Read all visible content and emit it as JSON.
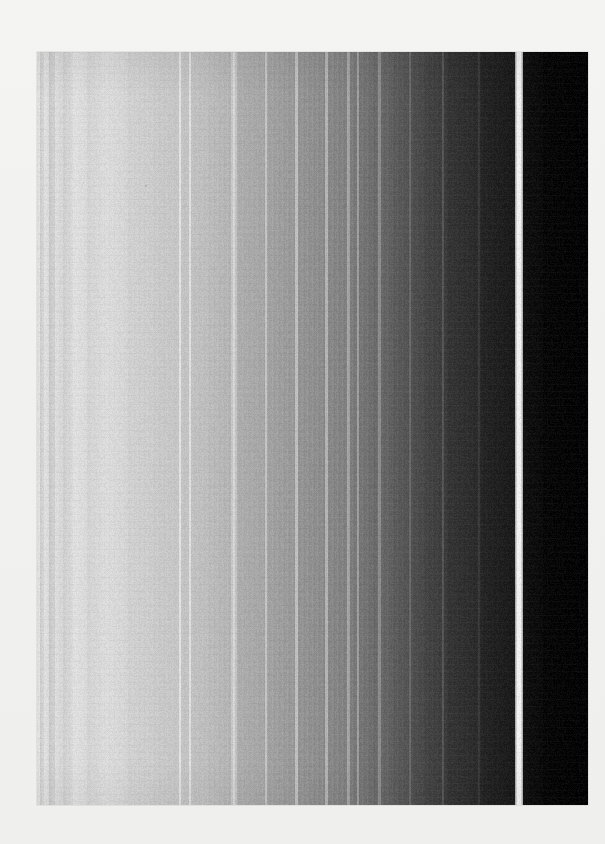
{
  "image": {
    "title": "Grayscale Vertical Band Gradient",
    "kind": "grayscale-band-spectrum",
    "canvas": {
      "width": 605,
      "height": 844
    },
    "background_color": "#f2f2f0",
    "plate": {
      "left": 37,
      "top": 52,
      "width": 551,
      "height": 753,
      "description": "Vertical grayscale bands progressing from near-white at left to pure black at right, separated by thin bright vertical lines."
    },
    "bands": [
      {
        "name": "band-01",
        "x": 0,
        "w": 3,
        "color_start": "#dddddd",
        "color_end": "#e8e8e8"
      },
      {
        "name": "band-02",
        "x": 3,
        "w": 4,
        "color_start": "#cfcfcf",
        "color_end": "#d8d8d8"
      },
      {
        "name": "band-03",
        "x": 7,
        "w": 5,
        "color_start": "#e4e4e4",
        "color_end": "#dcdcdc"
      },
      {
        "name": "band-04",
        "x": 12,
        "w": 6,
        "color_start": "#cccccc",
        "color_end": "#d4d4d4"
      },
      {
        "name": "band-05",
        "x": 18,
        "w": 8,
        "color_start": "#e0e0e0",
        "color_end": "#d9d9d9"
      },
      {
        "name": "band-06",
        "x": 26,
        "w": 10,
        "color_start": "#d2d2d2",
        "color_end": "#dcdcdc"
      },
      {
        "name": "band-07",
        "x": 36,
        "w": 14,
        "color_start": "#e3e3e3",
        "color_end": "#dddddd"
      },
      {
        "name": "band-08",
        "x": 50,
        "w": 18,
        "color_start": "#d6d6d6",
        "color_end": "#dedede"
      },
      {
        "name": "band-09",
        "x": 68,
        "w": 22,
        "color_start": "#dfdfdf",
        "color_end": "#d8d8d8"
      },
      {
        "name": "band-10",
        "x": 90,
        "w": 26,
        "color_start": "#d4d4d4",
        "color_end": "#cfcfcf"
      },
      {
        "name": "band-11",
        "x": 116,
        "w": 30,
        "color_start": "#cecece",
        "color_end": "#c7c7c7"
      },
      {
        "name": "band-12",
        "x": 146,
        "w": 24,
        "color_start": "#c6c6c6",
        "color_end": "#c0c0c0"
      },
      {
        "name": "band-13",
        "x": 170,
        "w": 24,
        "color_start": "#bfbfbf",
        "color_end": "#b6b6b6"
      },
      {
        "name": "band-14",
        "x": 194,
        "w": 6,
        "color_start": "#c9c9c9",
        "color_end": "#c4c4c4"
      },
      {
        "name": "band-15",
        "x": 200,
        "w": 30,
        "color_start": "#b0b0b0",
        "color_end": "#a6a6a6"
      },
      {
        "name": "band-16",
        "x": 230,
        "w": 30,
        "color_start": "#a4a4a4",
        "color_end": "#999999"
      },
      {
        "name": "band-17",
        "x": 260,
        "w": 26,
        "color_start": "#979797",
        "color_end": "#8d8d8d"
      },
      {
        "name": "band-18",
        "x": 286,
        "w": 26,
        "color_start": "#8b8b8b",
        "color_end": "#808080"
      },
      {
        "name": "band-19",
        "x": 312,
        "w": 22,
        "color_start": "#7e7e7e",
        "color_end": "#6f6f6f"
      },
      {
        "name": "band-20",
        "x": 334,
        "w": 20,
        "color_start": "#6d6d6d",
        "color_end": "#616161"
      },
      {
        "name": "band-21",
        "x": 354,
        "w": 16,
        "color_start": "#5e5e5e",
        "color_end": "#535353"
      },
      {
        "name": "band-22",
        "x": 370,
        "w": 18,
        "color_start": "#515151",
        "color_end": "#464646"
      },
      {
        "name": "band-23",
        "x": 388,
        "w": 22,
        "color_start": "#434343",
        "color_end": "#3a3a3a"
      },
      {
        "name": "band-24",
        "x": 410,
        "w": 34,
        "color_start": "#333333",
        "color_end": "#272727"
      },
      {
        "name": "band-25",
        "x": 444,
        "w": 34,
        "color_start": "#232323",
        "color_end": "#161616"
      },
      {
        "name": "band-26",
        "x": 478,
        "w": 8,
        "color_start": "#f2f2f2",
        "color_end": "#f6f6f6"
      },
      {
        "name": "band-27",
        "x": 486,
        "w": 20,
        "color_start": "#0d0d0d",
        "color_end": "#070707"
      },
      {
        "name": "band-28",
        "x": 506,
        "w": 45,
        "color_start": "#040404",
        "color_end": "#000000"
      }
    ],
    "separator_lines": [
      {
        "name": "separator-01",
        "x": 142,
        "w": 2,
        "color": "#e9e9e9"
      },
      {
        "name": "separator-02",
        "x": 152,
        "w": 2,
        "color": "#e6e6e6"
      },
      {
        "name": "separator-03",
        "x": 196,
        "w": 2,
        "color": "#dcdcdc"
      },
      {
        "name": "separator-04",
        "x": 228,
        "w": 2,
        "color": "#cacaca"
      },
      {
        "name": "separator-05",
        "x": 258,
        "w": 3,
        "color": "#c4c4c4"
      },
      {
        "name": "separator-06",
        "x": 288,
        "w": 3,
        "color": "#b8b8b8"
      },
      {
        "name": "separator-07",
        "x": 310,
        "w": 3,
        "color": "#a9a9a9"
      },
      {
        "name": "separator-08",
        "x": 320,
        "w": 2,
        "color": "#a2a2a2"
      },
      {
        "name": "separator-09",
        "x": 341,
        "w": 3,
        "color": "#929292"
      },
      {
        "name": "separator-10",
        "x": 372,
        "w": 2,
        "color": "#6e6e6e"
      },
      {
        "name": "separator-11",
        "x": 405,
        "w": 2,
        "color": "#555555"
      },
      {
        "name": "separator-12",
        "x": 441,
        "w": 2,
        "color": "#3a3a3a"
      }
    ],
    "highlight_gap": {
      "name": "bright-gap",
      "x": 478,
      "w": 8,
      "color": "#f5f5f5",
      "note": "Prominent near-white vertical gap separating the dark right bands"
    },
    "specks": [
      {
        "x": 108,
        "y": 133,
        "size": 2
      },
      {
        "x": 46,
        "y": 130,
        "size": 1
      }
    ]
  }
}
